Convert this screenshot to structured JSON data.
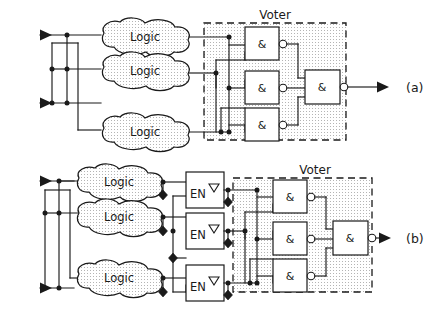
{
  "figure": {
    "type": "logic-circuit-diagram",
    "background_color": "#ffffff",
    "line_color": "#1a1a1a",
    "fill_color": "#ffffff",
    "stipple_color": "#9a9a9a"
  },
  "panels": [
    {
      "id": "a",
      "label": "(a)",
      "voter": {
        "label": "Voter",
        "gates": [
          {
            "label": "&",
            "name": "nand-gate-a1",
            "inverted_output": true
          },
          {
            "label": "&",
            "name": "nand-gate-a2",
            "inverted_output": true
          },
          {
            "label": "&",
            "name": "nand-gate-a3",
            "inverted_output": true
          },
          {
            "label": "&",
            "name": "nand-gate-a-out",
            "inverted_output": true
          }
        ]
      },
      "logic_blocks": [
        {
          "label": "Logic",
          "name": "logic-block-a1"
        },
        {
          "label": "Logic",
          "name": "logic-block-a2"
        },
        {
          "label": "Logic",
          "name": "logic-block-a3"
        }
      ],
      "inputs": [
        {
          "name": "input-arrow-a-top"
        },
        {
          "name": "input-arrow-a-bottom"
        }
      ],
      "outputs": [
        {
          "name": "output-arrow-a"
        }
      ]
    },
    {
      "id": "b",
      "label": "(b)",
      "voter": {
        "label": "Voter",
        "gates": [
          {
            "label": "&",
            "name": "nand-gate-b1",
            "inverted_output": true
          },
          {
            "label": "&",
            "name": "nand-gate-b2",
            "inverted_output": true
          },
          {
            "label": "&",
            "name": "nand-gate-b3",
            "inverted_output": true
          },
          {
            "label": "&",
            "name": "nand-gate-b-out",
            "inverted_output": true
          }
        ]
      },
      "logic_blocks": [
        {
          "label": "Logic",
          "name": "logic-block-b1"
        },
        {
          "label": "Logic",
          "name": "logic-block-b2"
        },
        {
          "label": "Logic",
          "name": "logic-block-b3"
        }
      ],
      "enable_buffers": [
        {
          "label": "EN",
          "marker": "▽",
          "name": "enable-buffer-b1"
        },
        {
          "label": "EN",
          "marker": "▽",
          "name": "enable-buffer-b2"
        },
        {
          "label": "EN",
          "marker": "▽",
          "name": "enable-buffer-b3"
        }
      ],
      "inputs": [
        {
          "name": "input-arrow-b-top"
        },
        {
          "name": "input-arrow-b-bottom"
        }
      ],
      "outputs": [
        {
          "name": "output-arrow-b"
        }
      ]
    }
  ]
}
